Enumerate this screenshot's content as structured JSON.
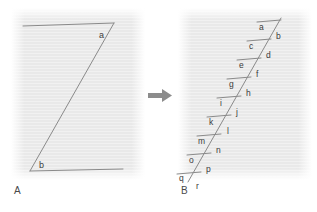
{
  "figure": {
    "background_color": "#ffffff",
    "panel_background_color": "#e9e9e9",
    "line_color": "#8a8a8a",
    "text_color": "#3d3d3d",
    "arrow_color": "#8c8c8c"
  },
  "panels": [
    {
      "id": "A",
      "label": "A",
      "description": "single long diagonal between two horizontal lines",
      "angle_labels": [
        "a",
        "b"
      ],
      "annotations": [
        {
          "text": "a",
          "x": 88,
          "y": 24
        },
        {
          "text": "b",
          "x": 28,
          "y": 156
        }
      ],
      "segments": [
        {
          "name": "top-horizontal",
          "x1": 12,
          "y1": 18,
          "x2": 103,
          "y2": 15
        },
        {
          "name": "main-diagonal",
          "x1": 103,
          "y1": 15,
          "x2": 19,
          "y2": 163
        },
        {
          "name": "bottom-horizontal",
          "x1": 19,
          "y1": 163,
          "x2": 112,
          "y2": 161
        }
      ]
    },
    {
      "id": "B",
      "label": "B",
      "description": "same diagonal broken into nine stepped tick pairs",
      "angle_labels": [
        "a",
        "b",
        "c",
        "d",
        "e",
        "f",
        "g",
        "h",
        "i",
        "j",
        "k",
        "l",
        "m",
        "n",
        "o",
        "p",
        "q",
        "r"
      ],
      "steps": [
        {
          "upper": "a",
          "lower": "b",
          "tick_x1": 79,
          "tick_y1": 14,
          "tick_x2": 103,
          "tick_y2": 12,
          "ux": 81,
          "uy": 22,
          "lx": 98,
          "ly": 31
        },
        {
          "upper": "c",
          "lower": "d",
          "tick_x1": 69,
          "tick_y1": 33,
          "tick_x2": 93,
          "tick_y2": 31,
          "ux": 71,
          "uy": 41,
          "lx": 88,
          "ly": 50
        },
        {
          "upper": "e",
          "lower": "f",
          "tick_x1": 59,
          "tick_y1": 52,
          "tick_x2": 83,
          "tick_y2": 50,
          "ux": 61,
          "uy": 60,
          "lx": 78,
          "ly": 69
        },
        {
          "upper": "g",
          "lower": "h",
          "tick_x1": 49,
          "tick_y1": 71,
          "tick_x2": 73,
          "tick_y2": 69,
          "ux": 51,
          "uy": 79,
          "lx": 68,
          "ly": 88
        },
        {
          "upper": "i",
          "lower": "j",
          "tick_x1": 39,
          "tick_y1": 90,
          "tick_x2": 63,
          "tick_y2": 88,
          "ux": 41,
          "uy": 98,
          "lx": 58,
          "ly": 107
        },
        {
          "upper": "k",
          "lower": "l",
          "tick_x1": 29,
          "tick_y1": 109,
          "tick_x2": 53,
          "tick_y2": 107,
          "ux": 31,
          "uy": 117,
          "lx": 48,
          "ly": 126
        },
        {
          "upper": "m",
          "lower": "n",
          "tick_x1": 19,
          "tick_y1": 128,
          "tick_x2": 43,
          "tick_y2": 126,
          "ux": 20,
          "uy": 136,
          "lx": 38,
          "ly": 145
        },
        {
          "upper": "o",
          "lower": "p",
          "tick_x1": 9,
          "tick_y1": 147,
          "tick_x2": 33,
          "tick_y2": 145,
          "ux": 11,
          "uy": 155,
          "lx": 28,
          "ly": 164
        },
        {
          "upper": "q",
          "lower": "r",
          "tick_x1": -1,
          "tick_y1": 166,
          "tick_x2": 23,
          "tick_y2": 164,
          "ux": 1,
          "uy": 174,
          "lx": 18,
          "ly": 182
        }
      ],
      "diagonal": {
        "x1": 103,
        "y1": 10,
        "x2": 10,
        "y2": 174
      }
    }
  ],
  "arrow": {
    "name": "transform-arrow",
    "direction": "right"
  }
}
